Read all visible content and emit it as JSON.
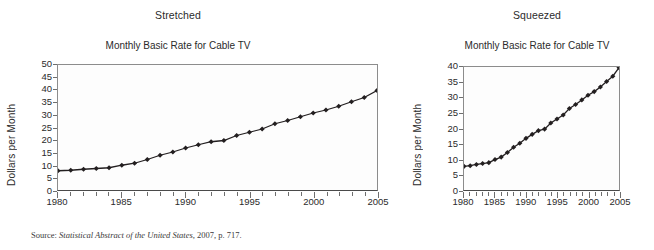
{
  "figure": {
    "source_note": {
      "label": "Source: ",
      "title": "Statistical Abstract of the United States,",
      "tail": " 2007, p. 717."
    }
  },
  "panels": [
    {
      "id": "stretched",
      "label": "Stretched",
      "title": "Monthly Basic Rate for Cable TV",
      "ylabel": "Dollars per Month",
      "yticks": [
        "0",
        "5",
        "10",
        "15",
        "20",
        "25",
        "30",
        "35",
        "40",
        "45",
        "50"
      ],
      "xticks": [
        "1980",
        "1985",
        "1990",
        "1995",
        "2000",
        "2005"
      ]
    },
    {
      "id": "squeezed",
      "label": "Squeezed",
      "title": "Monthly Basic Rate for Cable TV",
      "ylabel": "Dollars per Month",
      "yticks": [
        "0",
        "5",
        "10",
        "15",
        "20",
        "25",
        "30",
        "35",
        "40"
      ],
      "xticks": [
        "1980",
        "1985",
        "1990",
        "1995",
        "2000",
        "2005"
      ]
    }
  ],
  "chart_data": [
    {
      "type": "line",
      "title": "Monthly Basic Rate for Cable TV",
      "subtitle": "Stretched",
      "xlabel": "",
      "ylabel": "Dollars per Month",
      "xlim": [
        1980,
        2005
      ],
      "ylim": [
        0,
        50
      ],
      "ytick_step": 5,
      "xtick_step": 1,
      "xtick_labeled_step": 5,
      "grid": false,
      "legend": false,
      "marker": "diamond",
      "line_color": "#231f20",
      "x": [
        1980,
        1981,
        1982,
        1983,
        1984,
        1985,
        1986,
        1987,
        1988,
        1989,
        1990,
        1991,
        1992,
        1993,
        1994,
        1995,
        1996,
        1997,
        1998,
        1999,
        2000,
        2001,
        2002,
        2003,
        2004,
        2005
      ],
      "values": [
        7.7,
        7.9,
        8.3,
        8.6,
        8.9,
        9.9,
        10.7,
        12.2,
        13.9,
        15.2,
        16.8,
        18.1,
        19.3,
        19.8,
        21.8,
        23.1,
        24.4,
        26.5,
        27.8,
        29.3,
        30.8,
        32.0,
        33.5,
        35.3,
        37.0,
        39.8
      ]
    },
    {
      "type": "line",
      "title": "Monthly Basic Rate for Cable TV",
      "subtitle": "Squeezed",
      "xlabel": "",
      "ylabel": "Dollars per Month",
      "xlim": [
        1980,
        2005
      ],
      "ylim": [
        0,
        40
      ],
      "ytick_step": 5,
      "xtick_step": 1,
      "xtick_labeled_step": 5,
      "grid": false,
      "legend": false,
      "marker": "diamond",
      "line_color": "#231f20",
      "x": [
        1980,
        1981,
        1982,
        1983,
        1984,
        1985,
        1986,
        1987,
        1988,
        1989,
        1990,
        1991,
        1992,
        1993,
        1994,
        1995,
        1996,
        1997,
        1998,
        1999,
        2000,
        2001,
        2002,
        2003,
        2004,
        2005
      ],
      "values": [
        7.7,
        7.9,
        8.3,
        8.6,
        8.9,
        9.9,
        10.7,
        12.2,
        13.9,
        15.2,
        16.8,
        18.1,
        19.3,
        19.8,
        21.8,
        23.1,
        24.4,
        26.5,
        27.8,
        29.3,
        30.8,
        32.0,
        33.5,
        35.3,
        37.0,
        39.8
      ]
    }
  ]
}
